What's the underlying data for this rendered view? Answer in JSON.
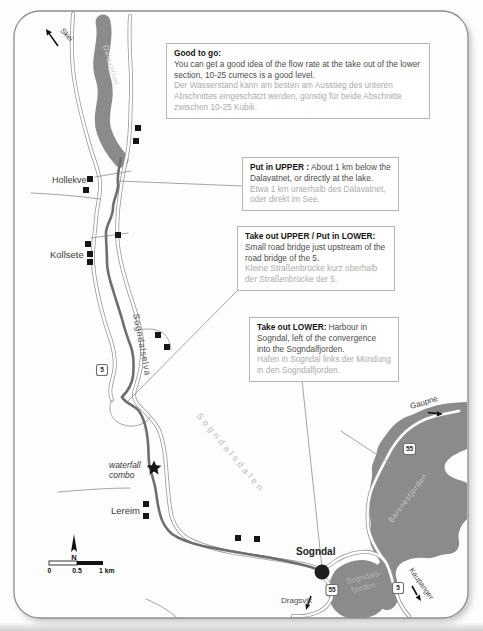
{
  "info_boxes": [
    {
      "title": "Good to go:",
      "en": "You can get a good idea of the flow rate at the take out of the lower section, 10-25 cumecs is a good level.",
      "de": "Der Wasserstand kann am besten am Ausstieg des unteren Abschnittes eingeschätzt werden, günstig für beide Abschnitte zwischen 10-25 Kubik."
    },
    {
      "title": "Put in UPPER :",
      "en": "About 1 km below the Dalavatnet, or directly at the lake.",
      "de": "Etwa 1 km unterhalb des Dalavatnet, oder direkt im See."
    },
    {
      "title": "Take out UPPER / Put in LOWER:",
      "en": "Small road bridge just upstream of the road bridge of the 5.",
      "de": "Kleine Straßenbrücke kurz oberhalb der Straßenbrücke der 5."
    },
    {
      "title": "Take out LOWER:",
      "en": "Harbour in Sogndal, left of the convergence into the Sogndalfjorden.",
      "de": "Hafen in Sogndal links der Mündung in den Sogndalfjorden."
    }
  ],
  "map": {
    "water_labels": {
      "lake": "Dalavatnet",
      "river": "Sogndalselva",
      "valley": "Sogndalsdalen",
      "fjord_ne": "Barsnesfjorden",
      "fjord_s_line1": "Sogndals-",
      "fjord_s_line2": "fjorden"
    },
    "places": {
      "hollekve": "Hollekve",
      "kollsete": "Kollsete",
      "lereim": "Lereim",
      "sogndal": "Sogndal",
      "waterfall_line1": "waterfall",
      "waterfall_line2": "combo"
    },
    "directions": {
      "skei": "Skei",
      "gaupne": "Gaupne",
      "dragsvik": "Dragsvik",
      "kaupanger": "Kaupanger"
    },
    "road_shields": {
      "valley_5": "5",
      "gaupne_55": "55",
      "sogndal_55": "55",
      "kaupanger_5": "5"
    },
    "scalebar": {
      "north": "N",
      "t0": "0",
      "t05": "0.5",
      "t1": "1 km"
    },
    "colors": {
      "water": "#8b8b8b",
      "river": "#6e6e6e",
      "road_casing": "#9a9a9a",
      "building": "#161616"
    }
  }
}
